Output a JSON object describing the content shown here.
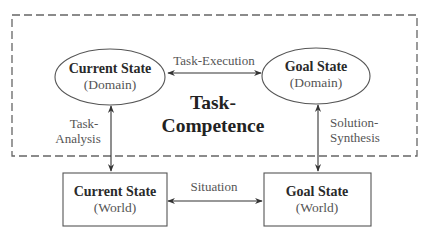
{
  "diagram": {
    "frame": {
      "label_line1": "Task-",
      "label_line2": "Competence",
      "style": "dashed"
    },
    "nodes": {
      "current_domain": {
        "title": "Current State",
        "subtitle": "(Domain)",
        "shape": "ellipse"
      },
      "goal_domain": {
        "title": "Goal State",
        "subtitle": "(Domain)",
        "shape": "ellipse"
      },
      "current_world": {
        "title": "Current State",
        "subtitle": "(World)",
        "shape": "rectangle"
      },
      "goal_world": {
        "title": "Goal State",
        "subtitle": "(World)",
        "shape": "rectangle"
      }
    },
    "edges": {
      "task_execution": {
        "label": "Task-Execution",
        "from": "Current State (Domain)",
        "to": "Goal State (Domain)",
        "direction": "bidirectional"
      },
      "situation": {
        "label": "Situation",
        "from": "Current State (World)",
        "to": "Goal State (World)",
        "direction": "bidirectional"
      },
      "task_analysis": {
        "label_line1": "Task-",
        "label_line2": "Analysis",
        "from": "Current State (Domain)",
        "to": "Current State (World)",
        "direction": "bidirectional"
      },
      "solution_synthesis": {
        "label_line1": "Solution-",
        "label_line2": "Synthesis",
        "from": "Goal State (Domain)",
        "to": "Goal State (World)",
        "direction": "bidirectional"
      }
    },
    "colors": {
      "stroke": "#555555",
      "text_bold": "#2a2a2a",
      "text_light": "#555555",
      "background": "#ffffff"
    }
  }
}
